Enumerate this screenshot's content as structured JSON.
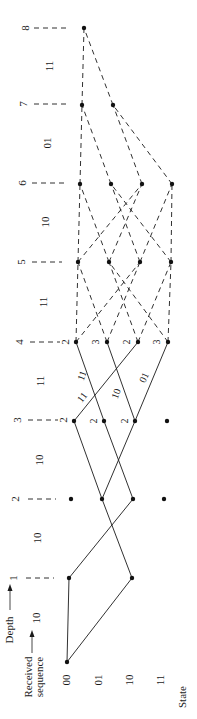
{
  "title_axis": {
    "depth_label": "Depth",
    "received_label_line1": "Received",
    "received_label_line2": "sequence",
    "state_axis_label": "State"
  },
  "states": [
    "00",
    "01",
    "10",
    "11"
  ],
  "depths": [
    "1",
    "2",
    "3",
    "4",
    "5",
    "6",
    "7",
    "8"
  ],
  "received_sequence": [
    "10",
    "10",
    "10",
    "11",
    "11",
    "10",
    "01",
    "11"
  ],
  "metrics": {
    "depth3": {
      "00": "2",
      "01": "2",
      "10": "2"
    },
    "depth4": {
      "00": "2",
      "01": "3",
      "10": "2",
      "11": "3"
    },
    "depth_tick_metrics": {
      "3": "2",
      "4": "2"
    }
  },
  "branch_labels": {
    "d3_00_to_d4_00": "11",
    "d3_00_to_d4_10": "11",
    "d3_10_to_d4_01": "10",
    "d3_10_to_d4_11": "01"
  },
  "colors": {
    "ink": "#1a1a1a",
    "background": "#ffffff"
  }
}
